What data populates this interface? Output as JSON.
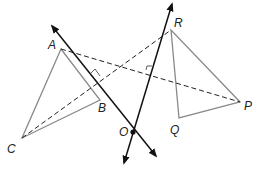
{
  "diagram": {
    "points": {
      "A": {
        "label": "A",
        "x": 61,
        "y": 49
      },
      "B": {
        "label": "B",
        "x": 100,
        "y": 100
      },
      "C": {
        "label": "C",
        "x": 22,
        "y": 138
      },
      "R": {
        "label": "R",
        "x": 171,
        "y": 30
      },
      "Q": {
        "label": "Q",
        "x": 179,
        "y": 118
      },
      "P": {
        "label": "P",
        "x": 240,
        "y": 102
      },
      "O": {
        "label": "O",
        "x": 133,
        "y": 132
      }
    },
    "triangles": [
      {
        "name": "ABC",
        "vertices": [
          "A",
          "B",
          "C"
        ]
      },
      {
        "name": "RQP",
        "vertices": [
          "R",
          "Q",
          "P"
        ]
      }
    ],
    "dashed_segments": [
      {
        "from": "A",
        "to": "P"
      },
      {
        "from": "C",
        "to": "R"
      }
    ],
    "lines": [
      {
        "name": "line-1",
        "through": "O",
        "arrows": "both"
      },
      {
        "name": "line-2",
        "through": "O",
        "arrows": "both"
      }
    ],
    "colors": {
      "triangle_stroke": "#8a8a8a",
      "line_stroke": "#111111",
      "dashed_stroke": "#222222"
    }
  }
}
